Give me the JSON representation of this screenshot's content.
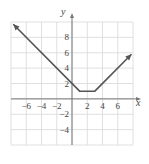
{
  "chart_data": {
    "type": "line",
    "title": "",
    "xlabel": "x",
    "ylabel": "y",
    "xlim": [
      -8,
      8
    ],
    "ylim": [
      -6,
      10
    ],
    "grid": true,
    "grid_step": 2,
    "x_ticks": [
      {
        "value": -6,
        "label": "−6"
      },
      {
        "value": -4,
        "label": "−4"
      },
      {
        "value": -2,
        "label": "−2"
      },
      {
        "value": 2,
        "label": "2"
      },
      {
        "value": 4,
        "label": "4"
      },
      {
        "value": 6,
        "label": "6"
      }
    ],
    "y_ticks": [
      {
        "value": 8,
        "label": "8"
      },
      {
        "value": 6,
        "label": "6"
      },
      {
        "value": 4,
        "label": "4"
      },
      {
        "value": 2,
        "label": "2"
      },
      {
        "value": -2,
        "label": "−2"
      },
      {
        "value": -4,
        "label": "−4"
      }
    ],
    "series": [
      {
        "name": "piecewise graph",
        "color": "#555555",
        "points": [
          [
            -7.7,
            9.7
          ],
          [
            1,
            1
          ],
          [
            3,
            1
          ],
          [
            7.8,
            5.8
          ]
        ],
        "arrows": [
          "start",
          "end"
        ]
      }
    ]
  }
}
